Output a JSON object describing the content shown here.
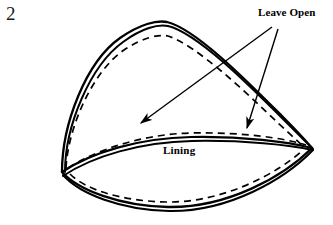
{
  "figure": {
    "step_number": "2",
    "background_color": "#ffffff",
    "ink_color": "#000000"
  },
  "labels": {
    "leave_open": "Leave Open",
    "lining": "Lining"
  },
  "annotations": [
    {
      "name": "leave-open-upper-arrow",
      "label": "Leave Open",
      "from": [
        272,
        27
      ],
      "to": [
        138,
        125
      ],
      "style": "solid-arrow"
    },
    {
      "name": "leave-open-lower-arrow",
      "label": "Leave Open",
      "from": [
        278,
        29
      ],
      "to": [
        246,
        131
      ],
      "style": "solid-arrow"
    }
  ],
  "shapes": {
    "outer_outline_style": "double-solid-line",
    "inner_outline_style": "dashed-line",
    "stroke_color": "#000000",
    "stroke_width_outer": 2.2,
    "stroke_width_inner": 1.6,
    "dash_pattern": "7 5"
  }
}
